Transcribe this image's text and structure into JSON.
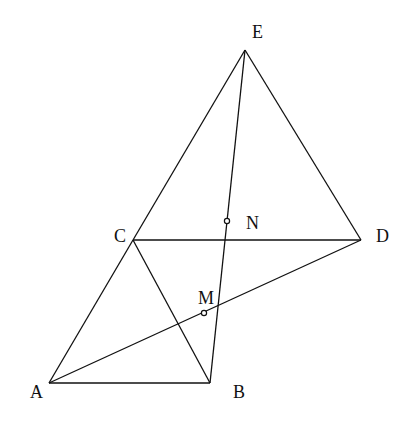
{
  "diagram": {
    "type": "geometry",
    "points": [
      {
        "id": "E",
        "label": "E",
        "x": 245,
        "y": 50,
        "lx": 252,
        "ly": 38
      },
      {
        "id": "C",
        "label": "C",
        "x": 133,
        "y": 240,
        "lx": 114,
        "ly": 242
      },
      {
        "id": "D",
        "label": "D",
        "x": 361,
        "y": 240,
        "lx": 376,
        "ly": 242
      },
      {
        "id": "A",
        "label": "A",
        "x": 49,
        "y": 383,
        "lx": 30,
        "ly": 398
      },
      {
        "id": "B",
        "label": "B",
        "x": 210,
        "y": 383,
        "lx": 233,
        "ly": 398
      },
      {
        "id": "N",
        "label": "N",
        "x": 227,
        "y": 221,
        "lx": 246,
        "ly": 229
      },
      {
        "id": "M",
        "label": "M",
        "x": 204,
        "y": 313,
        "lx": 198,
        "ly": 304
      }
    ],
    "segments": [
      [
        "A",
        "B"
      ],
      [
        "A",
        "C"
      ],
      [
        "C",
        "E"
      ],
      [
        "E",
        "D"
      ],
      [
        "C",
        "D"
      ],
      [
        "C",
        "B"
      ],
      [
        "A",
        "D"
      ],
      [
        "E",
        "B"
      ]
    ],
    "marked_points": [
      "N",
      "M"
    ],
    "stroke_color": "#111111"
  }
}
